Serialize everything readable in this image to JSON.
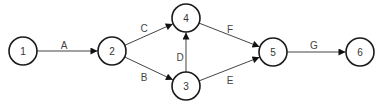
{
  "diagram": {
    "type": "activity-on-arrow network",
    "nodes": [
      {
        "id": "1",
        "label": "1",
        "x": 23,
        "y": 51
      },
      {
        "id": "2",
        "label": "2",
        "x": 112,
        "y": 51
      },
      {
        "id": "3",
        "label": "3",
        "x": 186,
        "y": 86
      },
      {
        "id": "4",
        "label": "4",
        "x": 186,
        "y": 18
      },
      {
        "id": "5",
        "label": "5",
        "x": 273,
        "y": 52
      },
      {
        "id": "6",
        "label": "6",
        "x": 360,
        "y": 52
      }
    ],
    "edges": [
      {
        "from": "1",
        "to": "2",
        "label": "A",
        "lx": 64,
        "ly": 45
      },
      {
        "from": "2",
        "to": "4",
        "label": "C",
        "lx": 144,
        "ly": 28
      },
      {
        "from": "2",
        "to": "3",
        "label": "B",
        "lx": 144,
        "ly": 77
      },
      {
        "from": "3",
        "to": "4",
        "label": "D",
        "lx": 180,
        "ly": 57
      },
      {
        "from": "4",
        "to": "5",
        "label": "F",
        "lx": 230,
        "ly": 29
      },
      {
        "from": "3",
        "to": "5",
        "label": "E",
        "lx": 230,
        "ly": 80
      },
      {
        "from": "5",
        "to": "6",
        "label": "G",
        "lx": 314,
        "ly": 45
      }
    ]
  }
}
